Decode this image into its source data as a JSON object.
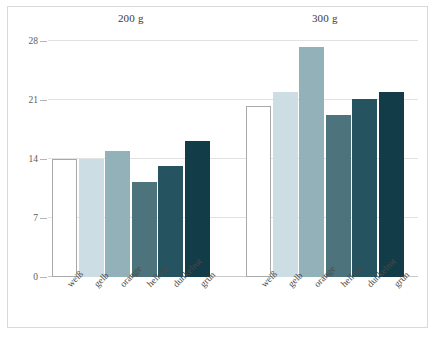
{
  "chart_data": {
    "type": "bar",
    "title": "",
    "subtitle": "",
    "xlabel": "",
    "ylabel": "",
    "ylim": [
      0,
      28
    ],
    "yticks": [
      0,
      7,
      14,
      21,
      28
    ],
    "ytick_labels": [
      "0",
      "7",
      "14",
      "21",
      "28"
    ],
    "grid": true,
    "legend": "none",
    "group_labels": [
      "200 g",
      "300 g"
    ],
    "categories": [
      "weiß",
      "gelb",
      "orange",
      "hellrot",
      "dunkelrot",
      "grün"
    ],
    "series": [
      {
        "name": "200 g",
        "values": [
          14.0,
          14.0,
          14.9,
          11.3,
          13.2,
          16.1
        ]
      },
      {
        "name": "300 g",
        "values": [
          20.3,
          21.9,
          27.3,
          19.2,
          21.1,
          22.0
        ]
      }
    ],
    "bar_colors": [
      "#ffffff",
      "#ccdde3",
      "#93b1b9",
      "#4d747c",
      "#255360",
      "#123c48"
    ],
    "bar_outline_color": "#a9a9a9",
    "gridline_color": "#e2e2e2",
    "axis_color": "#c9c9c9",
    "tick_text_color": "#5c5c5c",
    "label_text_color": "#4a4a4a",
    "background_color": "#ffffff",
    "frame_color": "#d9d9d9"
  },
  "groups": [
    {
      "label": "200 g",
      "bars": [
        {
          "category": "weiß",
          "value": 14.0,
          "color": "#ffffff",
          "outlined": true
        },
        {
          "category": "gelb",
          "value": 14.0,
          "color": "#ccdde3",
          "outlined": false
        },
        {
          "category": "orange",
          "value": 14.9,
          "color": "#93b1b9",
          "outlined": false
        },
        {
          "category": "hellrot",
          "value": 11.3,
          "color": "#4d747c",
          "outlined": false
        },
        {
          "category": "dunkelrot",
          "value": 13.2,
          "color": "#255360",
          "outlined": false
        },
        {
          "category": "grün",
          "value": 16.1,
          "color": "#123c48",
          "outlined": false
        }
      ]
    },
    {
      "label": "300 g",
      "bars": [
        {
          "category": "weiß",
          "value": 20.3,
          "color": "#ffffff",
          "outlined": true
        },
        {
          "category": "gelb",
          "value": 21.9,
          "color": "#ccdde3",
          "outlined": false
        },
        {
          "category": "orange",
          "value": 27.3,
          "color": "#93b1b9",
          "outlined": false
        },
        {
          "category": "hellrot",
          "value": 19.2,
          "color": "#4d747c",
          "outlined": false
        },
        {
          "category": "dunkelrot",
          "value": 21.1,
          "color": "#255360",
          "outlined": false
        },
        {
          "category": "grün",
          "value": 22.0,
          "color": "#123c48",
          "outlined": false
        }
      ]
    }
  ]
}
